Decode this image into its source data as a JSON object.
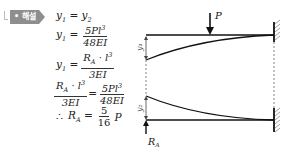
{
  "badge": {
    "label": "• 해설"
  },
  "equations": [
    {
      "lhs": "y₁ = y₂"
    },
    {
      "lhs": "y₁ =",
      "num": "5Pl³",
      "den": "48EI"
    },
    {
      "lhs": "y₁ =",
      "num": "R_A · l³",
      "den": "3EI"
    },
    {
      "num1": "R_A · l³",
      "den1": "3EI",
      "eq": "=",
      "num2": "5Pl³",
      "den2": "48EI"
    },
    {
      "prefix": "∴",
      "lhs": "R_A =",
      "num": "5",
      "den": "16",
      "suffix": "P"
    }
  ],
  "diagram": {
    "load_label": "P",
    "reaction_label": "R_A",
    "deflection_labels": [
      "y₁",
      "y₂"
    ],
    "support": "fixed-wall-right"
  }
}
